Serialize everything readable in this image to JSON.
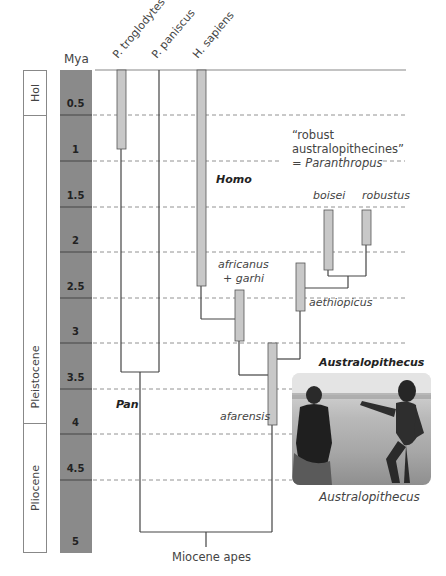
{
  "time_scale": {
    "header": "Mya",
    "ticks": [
      "0.5",
      "1",
      "1.5",
      "2",
      "2.5",
      "3",
      "3.5",
      "4",
      "4.5",
      "5"
    ]
  },
  "epochs": [
    {
      "label": "Hol",
      "from": 0,
      "to": 0.5
    },
    {
      "label": "Pleistocene",
      "from": 0.5,
      "to": 3.9
    },
    {
      "label": "Pliocene",
      "from": 3.9,
      "to": 5.3
    }
  ],
  "column_headers": [
    "P. troglodytes",
    "P. paniscus",
    "H. sapiens"
  ],
  "taxa": {
    "p_troglodytes": {
      "from": 0,
      "to": 1.0
    },
    "h_sapiens": {
      "from": 0,
      "to": 2.7
    },
    "africanus_garhi": {
      "label": "africanus\n+ garhi",
      "line1": "africanus",
      "line2": "+ garhi",
      "from": 2.6,
      "to": 3.2
    },
    "aethiopicus": {
      "label": "aethiopicus",
      "from": 2.3,
      "to": 2.8
    },
    "boisei": {
      "label": "boisei",
      "from": 1.5,
      "to": 2.2
    },
    "robustus": {
      "label": "robustus",
      "from": 1.5,
      "to": 2.0
    },
    "afarensis": {
      "label": "afarensis",
      "from": 3.1,
      "to": 4.0
    }
  },
  "group_labels": {
    "homo": "Homo",
    "pan": "Pan",
    "australopithecus": "Australopithecus",
    "robust_line1": "“robust",
    "robust_line2": "australopithecines”",
    "robust_line3_prefix": "= ",
    "robust_line3_genus": "Paranthropus"
  },
  "root_label": "Miocene apes",
  "photo": {
    "caption": "Australopithecus",
    "description": "Black-and-white photo of two Australopithecus reconstructions walking across grassland"
  },
  "colors": {
    "time_column": "#8a8a8a",
    "species_bar": "#c8c8c8",
    "lines": "#444444",
    "dashed": "#777777"
  }
}
